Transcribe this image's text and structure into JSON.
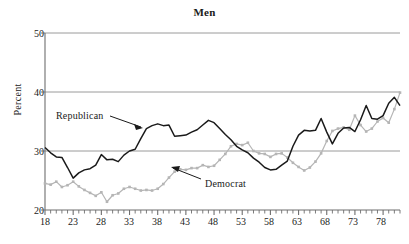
{
  "title": "Men",
  "partial_header_text": "",
  "axis": {
    "ylabel": "Percent",
    "yticks": [
      "20",
      "30",
      "40",
      "50"
    ],
    "xticks": [
      "18",
      "23",
      "28",
      "33",
      "38",
      "43",
      "48",
      "53",
      "58",
      "63",
      "68",
      "73",
      "78"
    ]
  },
  "annotations": {
    "republican": "Republican",
    "democrat": "Democrat"
  },
  "colors": {
    "republican_line": "#1a1a1a",
    "democrat_line": "#b5b5b5",
    "gridline": "#9a9a9a",
    "axis": "#6e6e6e",
    "text": "#1a1a1a"
  },
  "chart_data": {
    "type": "line",
    "title": "Men",
    "xlabel": "",
    "ylabel": "Percent",
    "xlim": [
      18,
      81
    ],
    "ylim": [
      20,
      50
    ],
    "yticks": [
      20,
      30,
      40,
      50
    ],
    "xticks": [
      18,
      23,
      28,
      33,
      38,
      43,
      48,
      53,
      58,
      63,
      68,
      73,
      78
    ],
    "grid": "horizontal",
    "legend": "inline-annotations",
    "x": [
      18,
      19,
      20,
      21,
      22,
      23,
      24,
      25,
      26,
      27,
      28,
      29,
      30,
      31,
      32,
      33,
      34,
      35,
      36,
      37,
      38,
      39,
      40,
      41,
      42,
      43,
      44,
      45,
      46,
      47,
      48,
      49,
      50,
      51,
      52,
      53,
      54,
      55,
      56,
      57,
      58,
      59,
      60,
      61,
      62,
      63,
      64,
      65,
      66,
      67,
      68,
      69,
      70,
      71,
      72,
      73,
      74,
      75,
      76,
      77,
      78,
      79,
      80,
      81
    ],
    "series": [
      {
        "name": "Republican",
        "marker": "none",
        "color": "#1a1a1a",
        "values": [
          30.6,
          29.7,
          29.0,
          28.9,
          27.2,
          25.4,
          26.3,
          26.8,
          27.0,
          27.6,
          29.4,
          28.5,
          28.6,
          28.2,
          29.3,
          30.0,
          30.3,
          32.1,
          33.8,
          34.3,
          34.6,
          34.3,
          34.4,
          32.5,
          32.6,
          32.7,
          33.2,
          33.6,
          34.4,
          35.2,
          34.8,
          33.8,
          32.8,
          31.9,
          30.8,
          30.2,
          29.7,
          28.8,
          28.1,
          27.2,
          26.8,
          26.9,
          27.6,
          28.3,
          30.8,
          32.7,
          33.5,
          33.4,
          33.5,
          35.5,
          33.2,
          31.2,
          33.0,
          33.9,
          34.0,
          33.3,
          35.3,
          37.7,
          35.5,
          35.4,
          36.0,
          38.1,
          39.1,
          37.7
        ]
      },
      {
        "name": "Democrat",
        "marker": "square",
        "color": "#b5b5b5",
        "values": [
          24.5,
          24.3,
          24.8,
          23.9,
          24.2,
          24.8,
          24.0,
          23.4,
          22.9,
          22.4,
          23.0,
          21.4,
          22.5,
          22.8,
          23.6,
          23.9,
          23.6,
          23.3,
          23.4,
          23.3,
          23.6,
          24.4,
          25.5,
          26.5,
          26.9,
          26.8,
          27.1,
          27.1,
          27.6,
          27.3,
          27.5,
          28.5,
          29.5,
          30.8,
          31.2,
          31.0,
          31.4,
          30.0,
          29.6,
          29.5,
          29.0,
          29.5,
          29.6,
          28.9,
          28.0,
          27.3,
          26.7,
          27.2,
          28.2,
          29.6,
          31.7,
          33.4,
          33.8,
          34.0,
          33.6,
          36.0,
          34.4,
          33.3,
          33.8,
          35.0,
          35.6,
          34.8,
          37.1,
          39.9
        ]
      }
    ]
  }
}
